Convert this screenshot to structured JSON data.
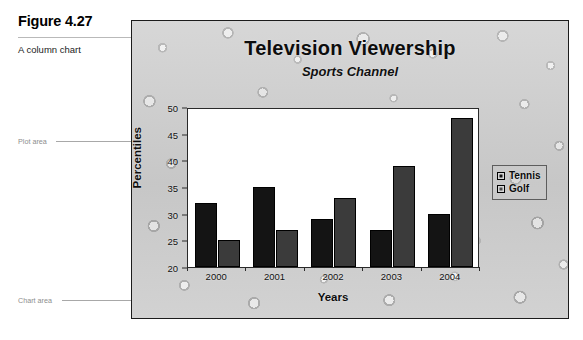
{
  "figure": {
    "number": "Figure 4.27",
    "description": "A column chart"
  },
  "callouts": [
    {
      "label": "Plot area"
    },
    {
      "label": "Chart area"
    }
  ],
  "chart_data": {
    "type": "bar",
    "title": "Television Viewership",
    "subtitle": "Sports Channel",
    "xlabel": "Years",
    "ylabel": "Percentiles",
    "categories": [
      "2000",
      "2001",
      "2002",
      "2003",
      "2004"
    ],
    "series": [
      {
        "name": "Tennis",
        "color": "#141414",
        "values": [
          32,
          35,
          29,
          27,
          30
        ]
      },
      {
        "name": "Golf",
        "color": "#3b3b3b",
        "values": [
          25,
          27,
          33,
          39,
          48
        ]
      }
    ],
    "ylim": [
      20,
      50
    ],
    "ytick_step": 5,
    "yticks": [
      "50",
      "45",
      "40",
      "35",
      "30",
      "25",
      "20"
    ],
    "grid": false,
    "legend_position": "right"
  }
}
